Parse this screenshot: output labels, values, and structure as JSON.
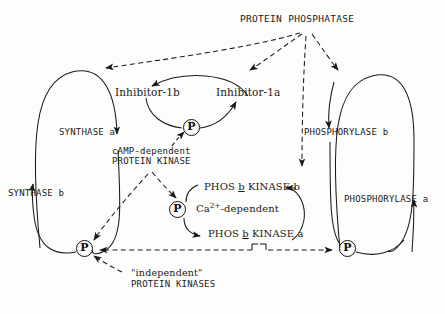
{
  "diagram": {
    "background_color": "#fdfdfb",
    "line_color": "#1a1a1a",
    "nodes": {
      "protein_phosphatase": "PROTEIN PHOSPHATASE",
      "inhibitor_1b": "Inhibitor-1b",
      "inhibitor_1a": "Inhibitor-1a",
      "synthase_a": "SYNTHASE a",
      "synthase_b": "SYNTHASE b",
      "phosphorylase_b": "PHOSPHORYLASE b",
      "phosphorylase_a": "PHOSPHORYLASE a",
      "camp_kinase_line1": "cAMP-dependent",
      "camp_kinase_line2": "PROTEIN KINASE",
      "phos_kinase_b_pre": "PHOS",
      "phos_kinase_b_under": "b",
      "phos_kinase_b_post": "KINASE b",
      "phos_kinase_a_pre": "PHOS",
      "phos_kinase_a_under": "b",
      "phos_kinase_a_post": "KINASE a",
      "ca_dependent_pre": "Ca",
      "ca_dependent_sup": "2+",
      "ca_dependent_post": "-dependent",
      "independent_line1": "\"independent\"",
      "independent_line2": "PROTEIN KINASES"
    },
    "phosphate_groups": [
      {
        "id": "p-inhibitor",
        "label": "P"
      },
      {
        "id": "p-phos-kinase",
        "label": "P"
      },
      {
        "id": "p-synthase",
        "label": "P"
      },
      {
        "id": "p-phosphorylase",
        "label": "P"
      }
    ],
    "legend": {
      "solid_line_meaning": "conversion reaction",
      "dashed_line_meaning": "catalysis / regulation"
    }
  }
}
